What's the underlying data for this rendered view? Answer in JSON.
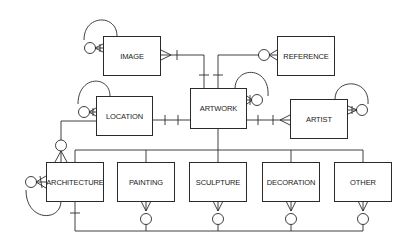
{
  "diagram": {
    "type": "entity-relationship",
    "notation": "crow's foot",
    "entities": [
      {
        "id": "image",
        "label": "IMAGE"
      },
      {
        "id": "reference",
        "label": "REFERENCE"
      },
      {
        "id": "artwork",
        "label": "ARTWORK"
      },
      {
        "id": "location",
        "label": "LOCATION"
      },
      {
        "id": "artist",
        "label": "ARTIST"
      },
      {
        "id": "architecture",
        "label": "ARCHITECTURE"
      },
      {
        "id": "painting",
        "label": "PAINTING"
      },
      {
        "id": "sculpture",
        "label": "SCULPTURE"
      },
      {
        "id": "decoration",
        "label": "DECORATION"
      },
      {
        "id": "other",
        "label": "OTHER"
      }
    ],
    "relationships": [
      {
        "from": "image",
        "to": "image",
        "type": "recursive",
        "end": "zero-or-many"
      },
      {
        "from": "reference",
        "to": "reference",
        "type": "recursive",
        "end": "zero-or-one"
      },
      {
        "from": "artwork",
        "to": "artwork",
        "type": "recursive",
        "end": "zero-or-many"
      },
      {
        "from": "location",
        "to": "location",
        "type": "recursive",
        "end": "zero-or-many"
      },
      {
        "from": "artist",
        "to": "artist",
        "type": "recursive",
        "end": "zero-or-many"
      },
      {
        "from": "architecture",
        "to": "architecture",
        "type": "recursive",
        "end": "zero-or-many"
      },
      {
        "from": "artwork",
        "to": "image",
        "from_end": "one",
        "to_end": "many"
      },
      {
        "from": "artwork",
        "to": "reference",
        "from_end": "one",
        "to_end": "zero-or-many"
      },
      {
        "from": "artwork",
        "to": "location",
        "from_end": "one",
        "to_end": "one"
      },
      {
        "from": "artwork",
        "to": "artist",
        "from_end": "one-and-only-one",
        "to_end": "many"
      },
      {
        "from": "location",
        "to": "architecture",
        "from_end": "one",
        "to_end": "zero-or-many"
      },
      {
        "from": "artwork",
        "to": [
          "architecture",
          "painting",
          "sculpture",
          "decoration",
          "other"
        ],
        "type": "subtype"
      },
      {
        "from": "architecture",
        "to": [
          "painting",
          "sculpture",
          "decoration",
          "other"
        ],
        "from_end": "one",
        "to_end": "zero-or-many"
      }
    ]
  },
  "colors": {
    "line": "#2a2a2a",
    "background": "#ffffff"
  }
}
